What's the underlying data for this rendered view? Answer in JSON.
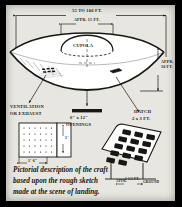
{
  "document": {
    "kind": "pictorial-sketch",
    "media": "scanned report page",
    "paper_color": "#e8e6e0",
    "ink_color": "#191714",
    "border_color": "#000000"
  },
  "diagram": {
    "title_object": "craft",
    "annotations": [
      {
        "id": "overall-width",
        "text": "55 TO 100 FT.",
        "role": "overall width dimension"
      },
      {
        "id": "cupola-width",
        "text": "APPR. 15 FT.",
        "role": "cupola width dimension"
      },
      {
        "id": "cupola",
        "text": "CUPOLA",
        "role": "part label"
      },
      {
        "id": "overall-height",
        "text": "APPR.",
        "role": "overall height dimension line 1"
      },
      {
        "id": "overall-height2",
        "text": "10 FT.",
        "role": "overall height dimension line 2"
      },
      {
        "id": "vent-label1",
        "text": "VENTILATION",
        "role": "callout line 1"
      },
      {
        "id": "vent-label2",
        "text": "OR EXHAUST",
        "role": "callout line 2"
      },
      {
        "id": "openings-size",
        "text": "6\" x 12\"",
        "role": "openings dimension"
      },
      {
        "id": "openings-label",
        "text": "OPENINGS",
        "role": "callout label"
      },
      {
        "id": "hatch-label",
        "text": "HATCH",
        "role": "callout label"
      },
      {
        "id": "hatch-size",
        "text": "2 x 3 FT.",
        "role": "hatch dimension"
      },
      {
        "id": "vent-height",
        "text": "1'",
        "role": "vent detail height"
      },
      {
        "id": "vent-width",
        "text": "1' 6\"",
        "role": "vent detail width"
      },
      {
        "id": "hatch-foot-l",
        "text": "APPR.",
        "role": "hatch leg note left"
      },
      {
        "id": "hatch-foot-c",
        "text": "2 1/2 FT.",
        "role": "hatch leg dimension"
      },
      {
        "id": "hatch-foot-r",
        "text": "GROUND",
        "role": "hatch leg note right"
      }
    ],
    "details": {
      "vent_grid": {
        "rows": 5,
        "cols": 6,
        "name": "ventilation grille detail"
      },
      "hatch_grid": {
        "rows": 5,
        "cols": 3,
        "name": "hatch step panel detail"
      }
    }
  },
  "caption": {
    "line1": "Pictorial description of the craft",
    "line2": "based upon the rough sketch",
    "line3": "made at the scene of landing."
  }
}
